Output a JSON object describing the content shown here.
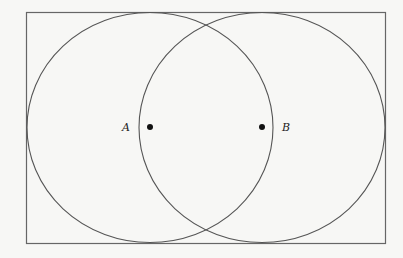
{
  "diagram": {
    "points": [
      {
        "label": "A",
        "x": 150,
        "y": 127
      },
      {
        "label": "B",
        "x": 262,
        "y": 127
      }
    ],
    "frame": {
      "x": 26,
      "y": 12,
      "width": 359,
      "height": 231
    },
    "stroke_color": "#555555"
  }
}
